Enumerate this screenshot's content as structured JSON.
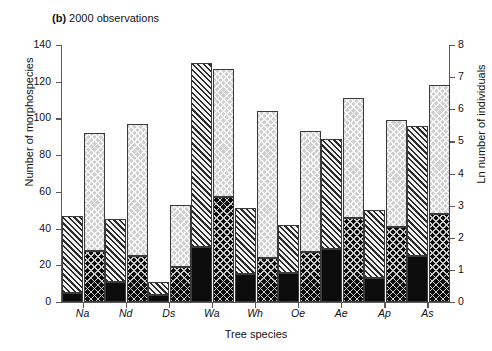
{
  "panel": {
    "letter": "(b)",
    "caption": "2000 observations"
  },
  "axes": {
    "left_title": "Number of morphospecies",
    "right_title": "Ln number of individuals",
    "x_title": "Tree species",
    "left_ticks": [
      "0",
      "20",
      "40",
      "60",
      "80",
      "100",
      "120",
      "140"
    ],
    "right_ticks": [
      "0",
      "1",
      "2",
      "3",
      "4",
      "5",
      "6",
      "7",
      "8"
    ]
  },
  "chart_data": {
    "type": "bar",
    "title": "(b) 2000 observations",
    "xlabel": "Tree species",
    "ylabel": "Number of morphospecies",
    "y2label": "Ln number of individuals",
    "ylim": [
      0,
      140
    ],
    "y2lim": [
      0,
      8
    ],
    "grid": false,
    "legend": "none",
    "stacked": true,
    "categories": [
      "Na",
      "Nd",
      "Ds",
      "Wa",
      "Wh",
      "Oe",
      "Ae",
      "Ap",
      "As"
    ],
    "bars": [
      {
        "name": "Morphospecies (left axis)",
        "axis": "left",
        "segments": [
          {
            "name": "lower",
            "fill": "solid-black",
            "values": [
              5,
              11,
              4,
              30,
              15,
              16,
              29,
              13,
              25
            ]
          },
          {
            "name": "upper",
            "fill": "diagonal-hatch-gray",
            "values": [
              42,
              34,
              7,
              100,
              36,
              26,
              60,
              37,
              71
            ]
          }
        ],
        "totals": [
          47,
          45,
          11,
          130,
          51,
          42,
          89,
          50,
          96
        ]
      },
      {
        "name": "Ln individuals (right axis)",
        "axis": "right",
        "segments": [
          {
            "name": "lower",
            "fill": "cross-hatch-dark",
            "values": [
              28,
              25,
              19,
              57,
              24,
              27,
              46,
              41,
              48
            ]
          },
          {
            "name": "upper",
            "fill": "cross-hatch-light",
            "values": [
              64,
              72,
              34,
              70,
              80,
              66,
              65,
              58,
              70
            ]
          }
        ],
        "totals": [
          92,
          97,
          53,
          127,
          104,
          93,
          111,
          99,
          118
        ]
      }
    ]
  },
  "colors": {
    "axis": "#5a5a5a",
    "solid_black": "#0c0c0c",
    "hatch_gray": "#f2f2f2",
    "cross_light": "#cfcfcf",
    "text": "#111111"
  }
}
